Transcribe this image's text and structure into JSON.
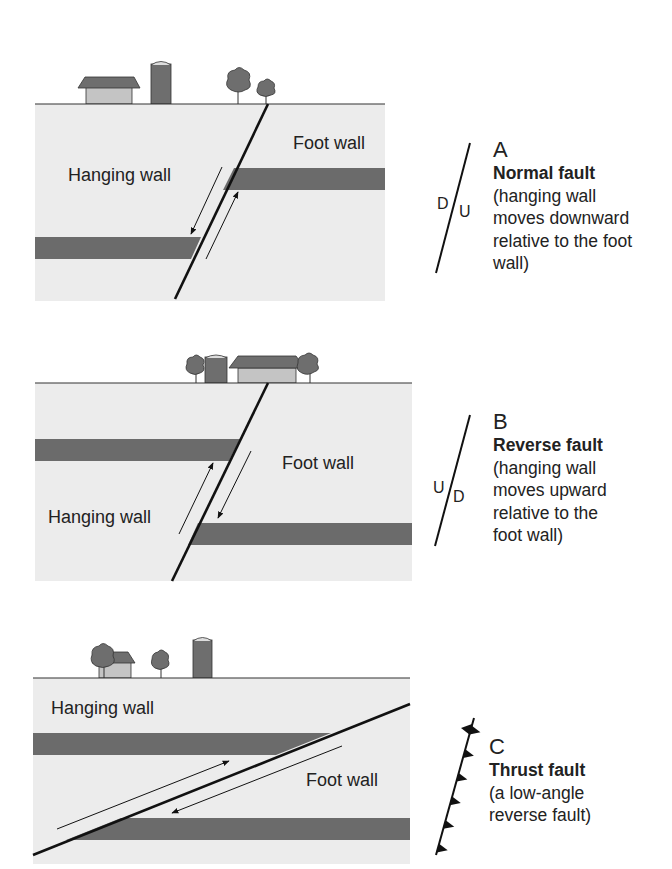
{
  "colors": {
    "ground": "#ececec",
    "layer": "#6b6b6b",
    "fault": "#111111",
    "building_dark": "#6e6e6e",
    "building_light": "#c4c4c4",
    "text": "#222222"
  },
  "panels": [
    {
      "id": "A",
      "letter": "A",
      "title": "Normal fault",
      "description": "(hanging wall\nmoves downward\nrelative to the foot\nwall)",
      "hanging_wall_label": "Hanging wall",
      "foot_wall_label": "Foot wall",
      "symbol_left": "D",
      "symbol_right": "U"
    },
    {
      "id": "B",
      "letter": "B",
      "title": "Reverse fault",
      "description": "(hanging wall\nmoves upward\nrelative to the\nfoot wall)",
      "hanging_wall_label": "Hanging wall",
      "foot_wall_label": "Foot wall",
      "symbol_left": "U",
      "symbol_right": "D"
    },
    {
      "id": "C",
      "letter": "C",
      "title": "Thrust fault",
      "description": "(a low-angle\nreverse fault)",
      "hanging_wall_label": "Hanging wall",
      "foot_wall_label": "Foot wall",
      "symbol": "thrust-teeth"
    }
  ]
}
